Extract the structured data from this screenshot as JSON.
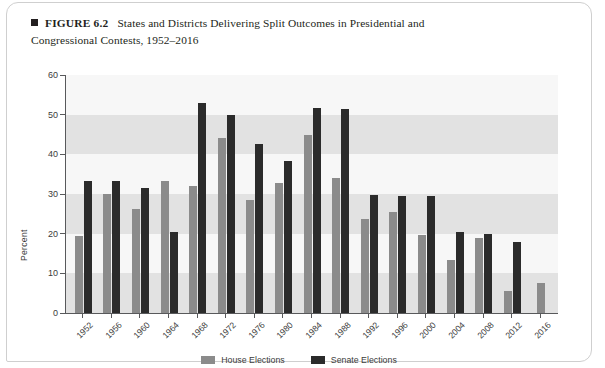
{
  "figure": {
    "bullet_icon": "square-bullet-icon",
    "label": "FIGURE 6.2",
    "title_line1": "States and Districts Delivering Split Outcomes in Presidential and",
    "title_line2": "Congressional Contests, 1952–2016"
  },
  "legend": {
    "house_label": "House Elections",
    "senate_label": "Senate Elections",
    "position": "bottom-center"
  },
  "colors": {
    "house": "#8b8b8b",
    "senate": "#2b2b2b",
    "axis": "#58595b",
    "band_light": "#f7f7f7",
    "band_dark": "#e2e2e2",
    "text": "#231f20"
  },
  "chart_data": {
    "type": "bar",
    "title": "States and Districts Delivering Split Outcomes in Presidential and Congressional Contests, 1952–2016",
    "xlabel": "",
    "ylabel": "Percent",
    "ylim": [
      0,
      60
    ],
    "yticks": [
      0,
      10,
      20,
      30,
      40,
      50,
      60
    ],
    "grid": false,
    "bands": true,
    "categories": [
      "1952",
      "1956",
      "1960",
      "1964",
      "1968",
      "1972",
      "1976",
      "1980",
      "1984",
      "1988",
      "1992",
      "1996",
      "2000",
      "2004",
      "2008",
      "2012",
      "2016"
    ],
    "series": [
      {
        "name": "House Elections",
        "color": "#8b8b8b",
        "values": [
          19.3,
          29.9,
          26.1,
          33.3,
          32.0,
          44.1,
          28.6,
          32.8,
          45.0,
          34.0,
          23.6,
          25.5,
          19.7,
          13.3,
          18.8,
          5.6,
          7.5
        ]
      },
      {
        "name": "Senate Elections",
        "color": "#2b2b2b",
        "values": [
          33.4,
          33.2,
          31.5,
          20.5,
          53.0,
          50.0,
          42.6,
          38.4,
          51.7,
          51.5,
          29.7,
          29.6,
          29.5,
          20.4,
          19.9,
          17.9,
          null
        ]
      }
    ]
  }
}
